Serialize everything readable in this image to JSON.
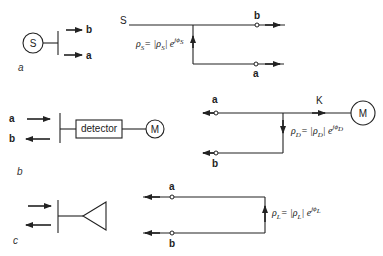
{
  "figure": {
    "panels": [
      {
        "id": "a",
        "label": "a",
        "source_symbol": "S",
        "port_labels": {
          "top": "b",
          "bottom": "a"
        },
        "network": {
          "node_label": "S",
          "reflection": {
            "lhs": "ρ",
            "lhs_sub": "S",
            "eq": "= |",
            "mag": "ρ",
            "mag_sub": "S",
            "exp": "| e",
            "exp_sup": "jϕ",
            "exp_sup_sub": "S"
          },
          "port_top": "b",
          "port_bottom": "a"
        }
      },
      {
        "id": "b",
        "label": "b",
        "port_labels": {
          "top": "a",
          "bottom": "b"
        },
        "detector_label": "detector",
        "meter_symbol": "M",
        "network": {
          "port_top": "a",
          "port_bottom": "b",
          "node_label": "K",
          "meter_symbol": "M",
          "reflection": {
            "lhs": "ρ",
            "lhs_sub": "D",
            "eq": "= |",
            "mag": "ρ",
            "mag_sub": "D",
            "exp": "| e",
            "exp_sup": "jϕ",
            "exp_sup_sub": "D"
          }
        }
      },
      {
        "id": "c",
        "label": "c",
        "network": {
          "port_top": "a",
          "port_bottom": "b",
          "reflection": {
            "lhs": "ρ",
            "lhs_sub": "L",
            "eq": "= |",
            "mag": "ρ",
            "mag_sub": "L",
            "exp": "| e",
            "exp_sup": "jϕ",
            "exp_sup_sub": "L"
          }
        }
      }
    ],
    "colors": {
      "ink": "#222222",
      "background": "#ffffff"
    }
  }
}
